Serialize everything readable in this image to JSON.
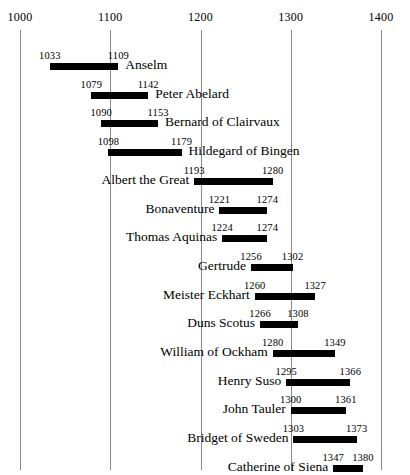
{
  "chart_data": {
    "type": "bar",
    "subtype": "timeline-gantt",
    "title": "",
    "xlabel": "",
    "ylabel": "",
    "xlim": [
      1000,
      1400
    ],
    "axis": {
      "ticks": [
        1000,
        1100,
        1200,
        1300,
        1400
      ],
      "tick_labels": [
        "1000",
        "1100",
        "1200",
        "1300",
        "1400"
      ],
      "grid": true,
      "grid_orientation": "vertical",
      "tick_label_position": "top"
    },
    "legend": null,
    "bar_color": "#000000",
    "gridline_color": "#8a8a8a",
    "categories": [
      "Anselm",
      "Peter Abelard",
      "Bernard of Clairvaux",
      "Hildegard of Bingen",
      "Albert the Great",
      "Bonaventure",
      "Thomas Aquinas",
      "Gertrude",
      "Meister Eckhart",
      "Duns Scotus",
      "William of Ockham",
      "Henry Suso",
      "John Tauler",
      "Bridget of Sweden",
      "Catherine of Siena"
    ],
    "rows": [
      {
        "label": "Anselm",
        "start": 1033,
        "end": 1109,
        "start_text": "1033",
        "end_text": "1109",
        "label_side": "right"
      },
      {
        "label": "Peter Abelard",
        "start": 1079,
        "end": 1142,
        "start_text": "1079",
        "end_text": "1142",
        "label_side": "right"
      },
      {
        "label": "Bernard of Clairvaux",
        "start": 1090,
        "end": 1153,
        "start_text": "1090",
        "end_text": "1153",
        "label_side": "right"
      },
      {
        "label": "Hildegard of Bingen",
        "start": 1098,
        "end": 1179,
        "start_text": "1098",
        "end_text": "1179",
        "label_side": "right"
      },
      {
        "label": "Albert the Great",
        "start": 1193,
        "end": 1280,
        "start_text": "1193",
        "end_text": "1280",
        "label_side": "left"
      },
      {
        "label": "Bonaventure",
        "start": 1221,
        "end": 1274,
        "start_text": "1221",
        "end_text": "1274",
        "label_side": "left"
      },
      {
        "label": "Thomas Aquinas",
        "start": 1224,
        "end": 1274,
        "start_text": "1224",
        "end_text": "1274",
        "label_side": "left"
      },
      {
        "label": "Gertrude",
        "start": 1256,
        "end": 1302,
        "start_text": "1256",
        "end_text": "1302",
        "label_side": "left"
      },
      {
        "label": "Meister Eckhart",
        "start": 1260,
        "end": 1327,
        "start_text": "1260",
        "end_text": "1327",
        "label_side": "left"
      },
      {
        "label": "Duns Scotus",
        "start": 1266,
        "end": 1308,
        "start_text": "1266",
        "end_text": "1308",
        "label_side": "left"
      },
      {
        "label": "William of Ockham",
        "start": 1280,
        "end": 1349,
        "start_text": "1280",
        "end_text": "1349",
        "label_side": "left"
      },
      {
        "label": "Henry Suso",
        "start": 1295,
        "end": 1366,
        "start_text": "1295",
        "end_text": "1366",
        "label_side": "left"
      },
      {
        "label": "John Tauler",
        "start": 1300,
        "end": 1361,
        "start_text": "1300",
        "end_text": "1361",
        "label_side": "left"
      },
      {
        "label": "Bridget of Sweden",
        "start": 1303,
        "end": 1373,
        "start_text": "1303",
        "end_text": "1373",
        "label_side": "left"
      },
      {
        "label": "Catherine of Siena",
        "start": 1347,
        "end": 1380,
        "start_text": "1347",
        "end_text": "1380",
        "label_side": "left"
      }
    ]
  }
}
